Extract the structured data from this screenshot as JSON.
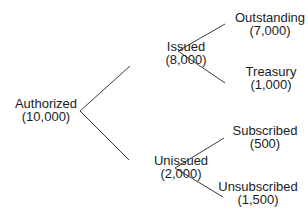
{
  "diagram": {
    "type": "tree",
    "nodes": [
      {
        "id": "authorized",
        "label": "Authorized",
        "value": "(10,000)"
      },
      {
        "id": "issued",
        "label": "Issued",
        "value": "(8,000)"
      },
      {
        "id": "unissued",
        "label": "Unissued",
        "value": "(2,000)"
      },
      {
        "id": "outstanding",
        "label": "Outstanding",
        "value": "(7,000)"
      },
      {
        "id": "treasury",
        "label": "Treasury",
        "value": "(1,000)"
      },
      {
        "id": "subscribed",
        "label": "Subscribed",
        "value": "(500)"
      },
      {
        "id": "unsubscribed",
        "label": "Unsubscribed",
        "value": "(1,500)"
      }
    ],
    "edges": [
      [
        "authorized",
        "issued"
      ],
      [
        "authorized",
        "unissued"
      ],
      [
        "issued",
        "outstanding"
      ],
      [
        "issued",
        "treasury"
      ],
      [
        "unissued",
        "subscribed"
      ],
      [
        "unissued",
        "unsubscribed"
      ]
    ]
  }
}
